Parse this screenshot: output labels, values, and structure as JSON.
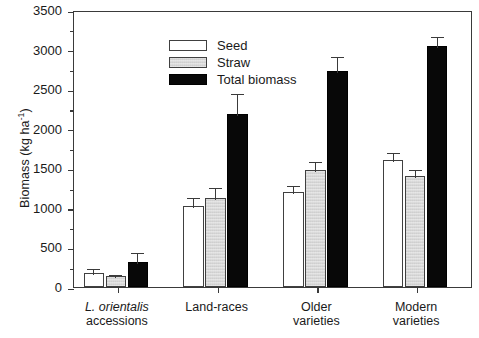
{
  "chart_data": {
    "type": "bar",
    "title": "",
    "xlabel": "",
    "ylabel": "Biomass (kg ha-1)",
    "ylabel_base": "Biomass (kg ha",
    "ylabel_sup": "-1",
    "ylabel_tail": ")",
    "ylim": [
      0,
      3500
    ],
    "ytick_step": 500,
    "grid": false,
    "legend_position": "top-left inside plot",
    "error_bars": "upper only (standard error)",
    "categories": [
      "L. orientalis accessions",
      "Land-races",
      "Older varieties",
      "Modern varieties"
    ],
    "category_lines": [
      [
        "L. orientalis",
        "accessions"
      ],
      [
        "Land-races"
      ],
      [
        "Older",
        "varieties"
      ],
      [
        "Modern",
        "varieties"
      ]
    ],
    "category_italic_first_line": [
      true,
      false,
      false,
      false
    ],
    "yticks": [
      0,
      500,
      1000,
      1500,
      2000,
      2500,
      3000,
      3500
    ],
    "ytick_labels": [
      "0",
      "500",
      "1000",
      "1500",
      "2000",
      "2500",
      "3000",
      "3500"
    ],
    "series": [
      {
        "name": "Seed",
        "color": "#ffffff",
        "values": [
          175,
          1020,
          1200,
          1610
        ],
        "errors": [
          75,
          130,
          100,
          110
        ]
      },
      {
        "name": "Straw",
        "color": "#d9d9d9",
        "values": [
          140,
          1120,
          1480,
          1400
        ],
        "errors": [
          40,
          160,
          130,
          100
        ]
      },
      {
        "name": "Total biomass",
        "color": "#080808",
        "values": [
          320,
          2180,
          2730,
          3040
        ],
        "errors": [
          130,
          280,
          200,
          140
        ]
      }
    ],
    "legend": [
      {
        "label": "Seed",
        "swatch": "seed"
      },
      {
        "label": "Straw",
        "swatch": "straw"
      },
      {
        "label": "Total biomass",
        "swatch": "total"
      }
    ]
  }
}
